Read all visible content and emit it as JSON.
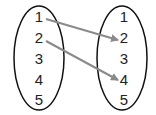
{
  "diagram": {
    "type": "mapping",
    "domain_set": {
      "elements": [
        "1",
        "2",
        "3",
        "4",
        "5"
      ]
    },
    "codomain_set": {
      "elements": [
        "1",
        "2",
        "3",
        "4",
        "5"
      ]
    },
    "mappings": [
      {
        "from": "1",
        "to": "2"
      },
      {
        "from": "2",
        "to": "4"
      }
    ],
    "colors": {
      "ellipse": "#111111",
      "arrow": "#8a8a8a",
      "text": "#222222"
    }
  }
}
